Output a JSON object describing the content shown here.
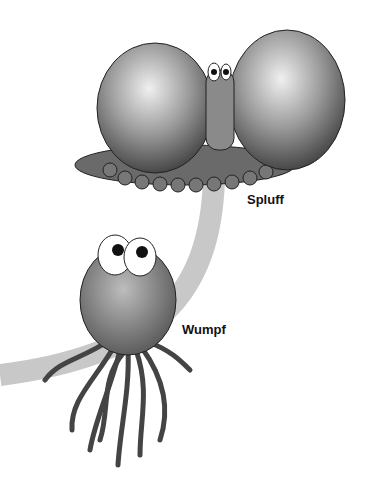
{
  "illustration": {
    "creatures": [
      {
        "name": "Spluff"
      },
      {
        "name": "Wumpf"
      }
    ],
    "colors": {
      "band": "#c8c8c8",
      "background": "#ffffff"
    }
  }
}
